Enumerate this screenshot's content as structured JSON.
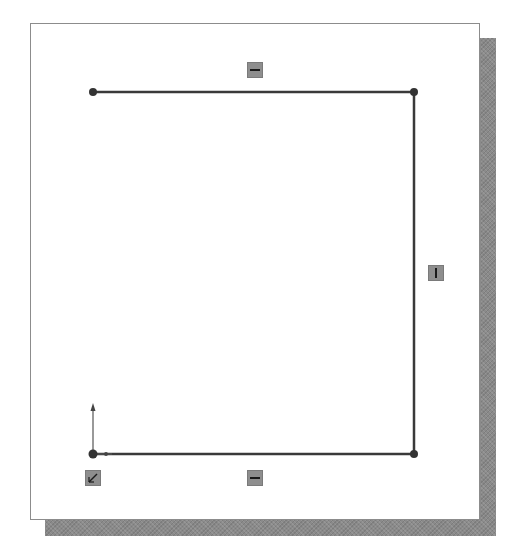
{
  "sketch": {
    "type": "open-rectangular-profile",
    "points": [
      {
        "name": "top-left",
        "x": 93,
        "y": 92
      },
      {
        "name": "top-right",
        "x": 414,
        "y": 92
      },
      {
        "name": "bottom-right",
        "x": 414,
        "y": 454
      },
      {
        "name": "bottom-left",
        "x": 93,
        "y": 454
      }
    ],
    "segments": [
      {
        "name": "top-line",
        "from": "top-left",
        "to": "top-right",
        "relation": "horizontal"
      },
      {
        "name": "right-line",
        "from": "top-right",
        "to": "bottom-right",
        "relation": "vertical"
      },
      {
        "name": "bottom-line",
        "from": "bottom-left",
        "to": "bottom-right",
        "relation": "horizontal"
      }
    ],
    "relations": [
      {
        "name": "horizontal-relation-top",
        "icon": "horizontal-relation-icon",
        "x": 255,
        "y": 70
      },
      {
        "name": "vertical-relation-right",
        "icon": "vertical-relation-icon",
        "x": 436,
        "y": 273
      },
      {
        "name": "horizontal-relation-bottom",
        "icon": "horizontal-relation-icon",
        "x": 255,
        "y": 478
      },
      {
        "name": "fixed-relation-origin",
        "icon": "fixed-relation-icon",
        "x": 93,
        "y": 478
      }
    ],
    "origin": {
      "x": 93,
      "y": 454,
      "icon": "origin-axes-icon"
    }
  },
  "colors": {
    "line": "#3a3a3a",
    "badge": "#8e8e8e",
    "badge_glyph": "#1a1a1a",
    "shadow": "#8a8a8a",
    "sheet_border": "#8c8c8c"
  }
}
